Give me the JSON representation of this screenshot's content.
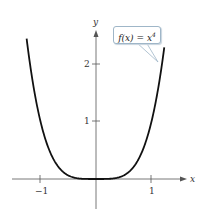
{
  "chart_data": {
    "type": "line",
    "title": "",
    "function_label": "f(x) = x^4",
    "xlabel": "x",
    "ylabel": "y",
    "xlim": [
      -1.3,
      1.5
    ],
    "ylim": [
      -0.5,
      2.6
    ],
    "x_ticks": [
      -1,
      1
    ],
    "x_tick_labels": [
      "−1",
      "1"
    ],
    "y_ticks": [
      1,
      2
    ],
    "y_tick_labels": [
      "1",
      "2"
    ],
    "grid": false,
    "legend": "none",
    "series": [
      {
        "name": "f(x) = x^4",
        "x": [
          -1.25,
          -1.0,
          -0.75,
          -0.5,
          -0.25,
          0,
          0.25,
          0.5,
          0.75,
          1.0,
          1.23
        ],
        "y": [
          2.44,
          1.0,
          0.316,
          0.0625,
          0.0039,
          0,
          0.0039,
          0.0625,
          0.316,
          1.0,
          2.29
        ]
      }
    ],
    "annotations": [
      {
        "text": "f(x) = x^4",
        "style": "callout",
        "points_to": [
          1.12,
          1.6
        ]
      }
    ]
  },
  "labels": {
    "x_axis": "x",
    "y_axis": "y",
    "tick_x_neg1": "−1",
    "tick_x_1": "1",
    "tick_y_1": "1",
    "tick_y_2": "2",
    "callout_base": "f(x) = x",
    "callout_exp": "4"
  }
}
